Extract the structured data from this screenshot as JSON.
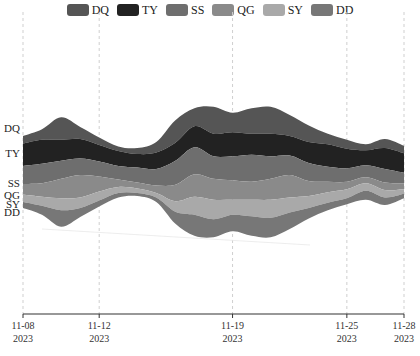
{
  "chart_data": {
    "type": "area",
    "subtype": "themeRiver",
    "title": "",
    "xlabel": "",
    "ylabel": "",
    "grid": false,
    "legend_position": "top",
    "x": [
      "2023-11-08",
      "2023-11-09",
      "2023-11-10",
      "2023-11-11",
      "2023-11-12",
      "2023-11-13",
      "2023-11-14",
      "2023-11-15",
      "2023-11-16",
      "2023-11-17",
      "2023-11-18",
      "2023-11-19",
      "2023-11-20",
      "2023-11-21",
      "2023-11-22",
      "2023-11-23",
      "2023-11-24",
      "2023-11-25",
      "2023-11-26",
      "2023-11-27",
      "2023-11-28"
    ],
    "x_ticks": [
      {
        "date": "2023-11-08",
        "line1": "11-08",
        "line2": "2023"
      },
      {
        "date": "2023-11-12",
        "line1": "11-12",
        "line2": "2023"
      },
      {
        "date": "2023-11-19",
        "line1": "11-19",
        "line2": "2023"
      },
      {
        "date": "2023-11-25",
        "line1": "11-25",
        "line2": "2023"
      },
      {
        "date": "2023-11-28",
        "line1": "11-28",
        "line2": "2023"
      }
    ],
    "series": [
      {
        "name": "DQ",
        "color": "#555555",
        "values": [
          10,
          14,
          30,
          16,
          10,
          6,
          8,
          14,
          30,
          24,
          36,
          26,
          34,
          36,
          28,
          22,
          14,
          12,
          8,
          12,
          10
        ]
      },
      {
        "name": "TY",
        "color": "#222222",
        "values": [
          30,
          32,
          28,
          26,
          22,
          20,
          18,
          22,
          24,
          28,
          30,
          32,
          28,
          30,
          26,
          28,
          30,
          26,
          20,
          28,
          26
        ]
      },
      {
        "name": "SS",
        "color": "#6e6e6e",
        "values": [
          24,
          26,
          24,
          22,
          20,
          18,
          20,
          22,
          32,
          36,
          30,
          32,
          36,
          30,
          26,
          24,
          20,
          18,
          16,
          18,
          14
        ]
      },
      {
        "name": "QG",
        "color": "#8a8a8a",
        "values": [
          14,
          18,
          26,
          30,
          20,
          10,
          8,
          10,
          22,
          30,
          28,
          26,
          24,
          28,
          30,
          20,
          14,
          10,
          8,
          10,
          8
        ]
      },
      {
        "name": "SY",
        "color": "#a9a9a9",
        "values": [
          10,
          12,
          16,
          14,
          12,
          8,
          6,
          6,
          14,
          24,
          26,
          20,
          22,
          24,
          20,
          16,
          14,
          12,
          10,
          10,
          6
        ]
      },
      {
        "name": "DD",
        "color": "#777777",
        "values": [
          8,
          12,
          22,
          12,
          8,
          6,
          4,
          6,
          16,
          28,
          24,
          22,
          26,
          26,
          22,
          14,
          10,
          8,
          12,
          10,
          6
        ]
      }
    ]
  },
  "legend": {
    "items": [
      {
        "label": "DQ",
        "color": "#555555"
      },
      {
        "label": "TY",
        "color": "#222222"
      },
      {
        "label": "SS",
        "color": "#6e6e6e"
      },
      {
        "label": "QG",
        "color": "#8a8a8a"
      },
      {
        "label": "SY",
        "color": "#a9a9a9"
      },
      {
        "label": "DD",
        "color": "#777777"
      }
    ]
  },
  "series_labels": [
    "DQ",
    "TY",
    "SS",
    "QG",
    "SY",
    "DD"
  ]
}
